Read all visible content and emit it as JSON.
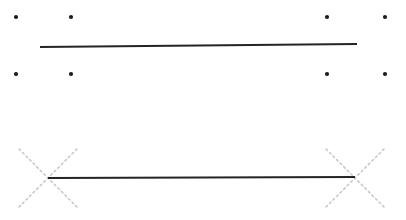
{
  "figure": {
    "title": "",
    "width": 406,
    "height": 220,
    "background_color": "#ffffff"
  },
  "colors": {
    "stroke_dark": "#242424",
    "marker_dark": "#1a1a1a",
    "marker_faint": "#c9c9c9"
  },
  "markers": {
    "dot_radius": 2.1,
    "dot_label": "point-marker",
    "cross_label": "cross-marker",
    "cross_arm": 29,
    "cross_dash": "2 3",
    "cross_width": 1.6
  },
  "points": [
    {
      "name": "dot-top-left-1",
      "x": 16,
      "y": 17
    },
    {
      "name": "dot-top-left-2",
      "x": 71,
      "y": 17
    },
    {
      "name": "dot-top-right-1",
      "x": 327,
      "y": 17
    },
    {
      "name": "dot-top-right-2",
      "x": 385,
      "y": 17
    },
    {
      "name": "dot-mid-left-1",
      "x": 16,
      "y": 74
    },
    {
      "name": "dot-mid-left-2",
      "x": 71,
      "y": 74
    },
    {
      "name": "dot-mid-right-1",
      "x": 327,
      "y": 74
    },
    {
      "name": "dot-mid-right-2",
      "x": 385,
      "y": 74
    }
  ],
  "crosses": [
    {
      "name": "cross-left",
      "x": 48,
      "y": 178
    },
    {
      "name": "cross-right",
      "x": 355,
      "y": 178
    }
  ],
  "segments": [
    {
      "name": "upper-line",
      "x1": 40,
      "y1": 47,
      "x2": 357,
      "y2": 44,
      "width": 1.8
    },
    {
      "name": "lower-line",
      "x1": 48,
      "y1": 178,
      "x2": 355,
      "y2": 177,
      "width": 2.1
    }
  ]
}
